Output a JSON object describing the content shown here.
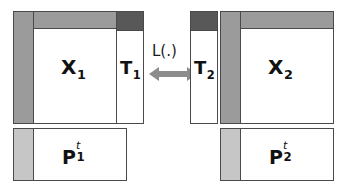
{
  "diagram": {
    "colors": {
      "background": "#ffffff",
      "outline": "#4a4a4a",
      "dark_gray": "#585858",
      "medium_gray": "#9b9b9b",
      "light_gray": "#c6c6c6",
      "arrow_gray": "#8c8c8c",
      "text": "#111111"
    },
    "left_group": {
      "data_matrix": {
        "label_base": "X",
        "label_sub": "1",
        "name": "X-1"
      },
      "component_matrix": {
        "label_base": "T",
        "label_sub": "1",
        "name": "T-1"
      },
      "loading_matrix": {
        "label_base": "P",
        "label_sup": "t",
        "label_sub": "1",
        "name": "P-1-transpose"
      }
    },
    "right_group": {
      "data_matrix": {
        "label_base": "X",
        "label_sub": "2",
        "name": "X-2"
      },
      "component_matrix": {
        "label_base": "T",
        "label_sub": "2",
        "name": "T-2"
      },
      "loading_matrix": {
        "label_base": "P",
        "label_sup": "t",
        "label_sub": "2",
        "name": "P-2-transpose"
      }
    },
    "link": {
      "label": "L(.)",
      "direction": "bidirectional"
    }
  }
}
